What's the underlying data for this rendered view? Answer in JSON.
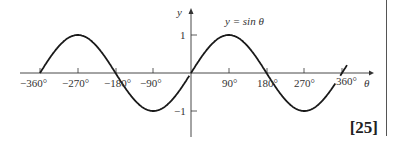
{
  "chart_data": {
    "type": "line",
    "title": "",
    "annotation": "y = sin θ",
    "xlabel": "θ",
    "ylabel": "y",
    "x_ticks": [
      "−360°",
      "−270°",
      "−180°",
      "−90°",
      "90°",
      "180°",
      "270°",
      "360°"
    ],
    "y_ticks": [
      "1",
      "−1"
    ],
    "xlim": [
      -360,
      360
    ],
    "ylim": [
      -1,
      1
    ],
    "grid": false,
    "series": [
      {
        "name": "y = sin θ",
        "x": [
          -360,
          -270,
          -180,
          -90,
          0,
          90,
          180,
          270,
          360
        ],
        "values": [
          0,
          1,
          0,
          -1,
          0,
          1,
          0,
          -1,
          0
        ]
      }
    ]
  },
  "marks": "[25]"
}
